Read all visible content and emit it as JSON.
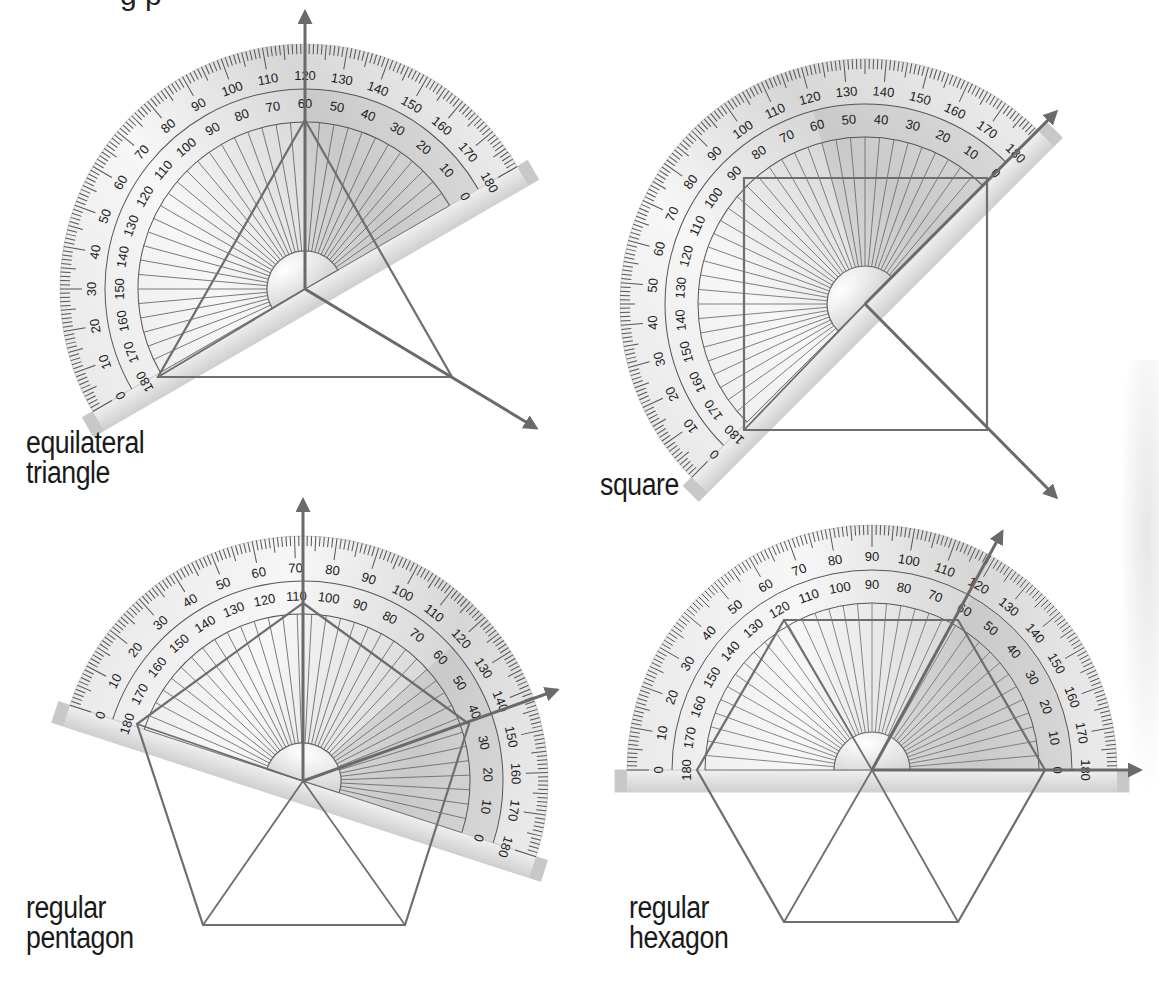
{
  "page": {
    "title_fragment": "g                                                p",
    "colors": {
      "ink": "#1a1a1a",
      "line": "#6e6e6e",
      "arrow": "#6a6a6a",
      "protractor_light": "#f2f2f2",
      "protractor_mid": "#dcdcdc",
      "protractor_dark": "#c4c4c4",
      "tick": "#555555"
    }
  },
  "panels": [
    {
      "id": "equilateral-triangle",
      "label_lines": [
        "equilateral",
        "triangle"
      ],
      "label_pos": [
        26,
        428
      ],
      "protractor": {
        "cx": 305,
        "cy": 289,
        "r": 245,
        "base_angle_deg": -30
      },
      "outer_scale_labels": [
        "0",
        "10",
        "20",
        "30",
        "40",
        "50",
        "60",
        "70",
        "80",
        "90",
        "100",
        "110",
        "120",
        "130",
        "140",
        "150",
        "160",
        "170",
        "180"
      ],
      "inner_scale_labels": [
        "180",
        "170",
        "160",
        "150",
        "140",
        "130",
        "120",
        "110",
        "100",
        "90",
        "80",
        "70",
        "60",
        "50",
        "40",
        "30",
        "20",
        "10",
        "0"
      ],
      "shape_points": [
        [
          305,
          120
        ],
        [
          452,
          377
        ],
        [
          158,
          377
        ]
      ],
      "center_spokes": [
        [
          158,
          377
        ]
      ],
      "arrows": [
        {
          "to": [
            305,
            12
          ]
        },
        {
          "to": [
            536,
            428
          ]
        }
      ],
      "read_angle": "60"
    },
    {
      "id": "square",
      "label_lines": [
        "square"
      ],
      "label_pos": [
        600,
        470
      ],
      "protractor": {
        "cx": 865,
        "cy": 304,
        "r": 245,
        "base_angle_deg": -45
      },
      "outer_scale_labels": [
        "0",
        "10",
        "20",
        "30",
        "40",
        "50",
        "60",
        "70",
        "80",
        "90",
        "100",
        "110",
        "120",
        "130",
        "140",
        "150",
        "160",
        "170",
        "180"
      ],
      "inner_scale_labels": [
        "180",
        "170",
        "160",
        "150",
        "140",
        "130",
        "120",
        "110",
        "100",
        "90",
        "80",
        "70",
        "60",
        "50",
        "40",
        "30",
        "20",
        "10",
        "0"
      ],
      "shape_points": [
        [
          744,
          178
        ],
        [
          987,
          178
        ],
        [
          987,
          430
        ],
        [
          744,
          430
        ]
      ],
      "center_spokes": [
        [
          744,
          430
        ]
      ],
      "arrows": [
        {
          "to": [
            1056,
            112
          ]
        },
        {
          "to": [
            1056,
            497
          ]
        }
      ],
      "read_angle": "90"
    },
    {
      "id": "regular-pentagon",
      "label_lines": [
        "regular",
        "pentagon"
      ],
      "label_pos": [
        26,
        893
      ],
      "protractor": {
        "cx": 303,
        "cy": 781,
        "r": 245,
        "base_angle_deg": 18
      },
      "outer_scale_labels": [
        "0",
        "10",
        "20",
        "30",
        "40",
        "50",
        "60",
        "70",
        "80",
        "90",
        "100",
        "110",
        "120",
        "130",
        "140",
        "150",
        "160",
        "170",
        "180"
      ],
      "inner_scale_labels": [
        "180",
        "170",
        "160",
        "150",
        "140",
        "130",
        "120",
        "110",
        "100",
        "90",
        "80",
        "70",
        "60",
        "50",
        "40",
        "30",
        "20",
        "10",
        "0"
      ],
      "shape_points": [
        [
          303,
          603
        ],
        [
          469,
          724
        ],
        [
          405,
          925
        ],
        [
          203,
          925
        ],
        [
          137,
          724
        ]
      ],
      "center_spokes": [
        [
          137,
          724
        ],
        [
          203,
          925
        ],
        [
          405,
          925
        ]
      ],
      "arrows": [
        {
          "to": [
            303,
            500
          ]
        },
        {
          "to": [
            557,
            690
          ]
        }
      ],
      "read_angle": "72"
    },
    {
      "id": "regular-hexagon",
      "label_lines": [
        "regular",
        "hexagon"
      ],
      "label_pos": [
        629,
        893
      ],
      "protractor": {
        "cx": 872,
        "cy": 770,
        "r": 245,
        "base_angle_deg": 0
      },
      "outer_scale_labels": [
        "0",
        "10",
        "20",
        "30",
        "40",
        "50",
        "60",
        "70",
        "80",
        "90",
        "100",
        "110",
        "120",
        "130",
        "140",
        "150",
        "160",
        "170",
        "180"
      ],
      "inner_scale_labels": [
        "180",
        "170",
        "160",
        "150",
        "140",
        "130",
        "120",
        "110",
        "100",
        "90",
        "80",
        "70",
        "60",
        "50",
        "40",
        "30",
        "20",
        "10",
        "0"
      ],
      "shape_points": [
        [
          697,
          770
        ],
        [
          784,
          620
        ],
        [
          958,
          620
        ],
        [
          1045,
          770
        ],
        [
          958,
          922
        ],
        [
          784,
          922
        ]
      ],
      "center_spokes": [
        [
          784,
          620
        ],
        [
          784,
          922
        ],
        [
          958,
          922
        ]
      ],
      "arrows": [
        {
          "to": [
            1140,
            770
          ]
        },
        {
          "to": [
            1002,
            532
          ]
        }
      ],
      "read_angle": "60"
    }
  ]
}
